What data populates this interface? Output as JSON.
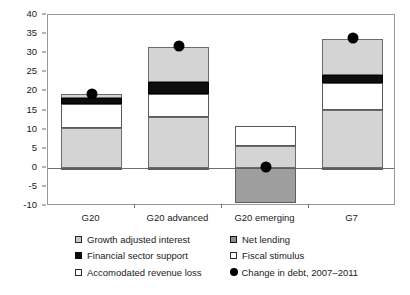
{
  "chart_data": {
    "type": "bar",
    "title": "",
    "subtitle": "",
    "xlabel": "",
    "ylabel": "",
    "stacked": true,
    "grid": false,
    "legend_position": "bottom",
    "categories": [
      "G20",
      "G20 advanced",
      "G20 emerging",
      "G7"
    ],
    "ylim": [
      -10,
      40
    ],
    "yticks": [
      -10,
      -5,
      0,
      5,
      10,
      15,
      20,
      25,
      30,
      35,
      40
    ],
    "ytick_labels": [
      "-10",
      "-5",
      "0",
      "5",
      "10",
      "15",
      "20",
      "25",
      "30",
      "35",
      "40"
    ],
    "series": [
      {
        "name": "Accomodated revenue loss",
        "key": "revloss",
        "color": "#d4d4d4",
        "values": [
          10.3,
          13.4,
          5.8,
          15.1
        ]
      },
      {
        "name": "Fiscal stimulus",
        "key": "fiscal",
        "color": "#ffffff",
        "values": [
          6.4,
          5.9,
          5.2,
          7.2
        ]
      },
      {
        "name": "Financial sector support",
        "key": "finsec",
        "color": "#0d0d0d",
        "values": [
          1.6,
          3.1,
          0.0,
          1.9
        ]
      },
      {
        "name": "Growth adjusted interest",
        "key": "growth",
        "color": "#d4d4d4",
        "values": [
          0.9,
          9.3,
          0.0,
          9.4
        ]
      },
      {
        "name": "Net lending",
        "key": "netlend",
        "color": "#9e9e9e",
        "values": [
          -0.6,
          -0.4,
          -9.3,
          -0.5
        ]
      }
    ],
    "markers": {
      "name": "Change in debt, 2007–2011",
      "color": "#000000",
      "shape": "circle",
      "values": [
        19.4,
        31.8,
        0.2,
        33.9
      ]
    }
  },
  "legend": {
    "left_column": [
      {
        "label": "Growth adjusted interest",
        "swatch": "sw-growth",
        "icon": "square-swatch-gray"
      },
      {
        "label": "Financial sector support",
        "swatch": "sw-finsec",
        "icon": "square-swatch-black"
      },
      {
        "label": "Accomodated revenue loss",
        "swatch": "sw-revloss",
        "icon": "square-swatch-white"
      }
    ],
    "right_column": [
      {
        "label": "Net lending",
        "swatch": "sw-netlend",
        "icon": "square-swatch-darkgray"
      },
      {
        "label": "Fiscal stimulus",
        "swatch": "sw-fiscal",
        "icon": "square-swatch-white"
      },
      {
        "label": "Change in debt, 2007–2011",
        "swatch": "sw-dot",
        "icon": "circle-marker-black"
      }
    ]
  }
}
